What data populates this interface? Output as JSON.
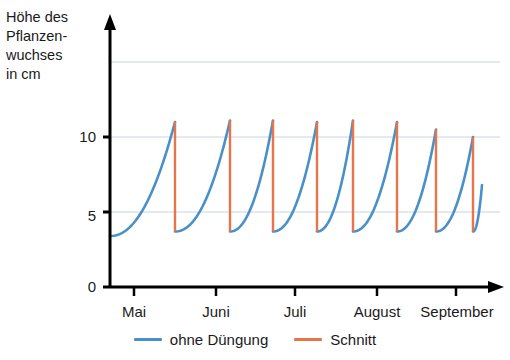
{
  "chart_data": {
    "type": "line",
    "title": "",
    "ylabel_lines": [
      "Höhe des",
      "Pflanzen-",
      "wuchses",
      "in cm"
    ],
    "ylabel": "Höhe des Pflanzenwuchses in cm",
    "xlabel": "",
    "ylim": [
      0,
      17
    ],
    "yticks": [
      0,
      5,
      10
    ],
    "ytick_labels": [
      "0",
      "5",
      "10"
    ],
    "gridlines_y": [
      5,
      10,
      15
    ],
    "grid": true,
    "xtick_labels": [
      "Mai",
      "Juni",
      "Juli",
      "August",
      "September"
    ],
    "xtick_positions": [
      134,
      216,
      295,
      377,
      456
    ],
    "legend_position": "bottom-center",
    "series": [
      {
        "name": "ohne Düngung",
        "color": "#4a90c8",
        "type": "growth-curve",
        "description": "Wachstumskurve zwischen den Schnitten, steigt jeweils von ca. 3,7 cm auf die Schnitthöhe an",
        "cut_to_height": 3.7,
        "start_height": 3.4,
        "end_height": 6.8,
        "peaks": [
          11.0,
          11.1,
          11.1,
          11.0,
          11.1,
          11.0,
          10.5,
          10.0
        ]
      },
      {
        "name": "Schnitt",
        "color": "#e8744a",
        "type": "vertical-drop",
        "description": "Senkrechter Abfall beim Schnitt auf ca. 3,7 cm",
        "cut_x_positions": [
          175,
          230,
          273,
          317,
          353,
          397,
          436,
          473
        ],
        "cut_from": [
          11.0,
          11.1,
          11.1,
          11.0,
          11.1,
          11.0,
          10.5,
          10.0
        ],
        "cut_to": 3.7
      }
    ]
  },
  "legend": {
    "items": [
      {
        "label": "ohne Düngung",
        "color": "#4a90c8"
      },
      {
        "label": "Schnitt",
        "color": "#e8744a"
      }
    ]
  },
  "axis": {
    "y_title_line1": "Höhe des",
    "y_title_line2": "Pflanzen-",
    "y_title_line3": "wuchses",
    "y_title_line4": "in cm",
    "y_tick_0": "0",
    "y_tick_5": "5",
    "y_tick_10": "10",
    "x_tick_1": "Mai",
    "x_tick_2": "Juni",
    "x_tick_3": "Juli",
    "x_tick_4": "August",
    "x_tick_5": "September"
  },
  "colors": {
    "curve": "#4a90c8",
    "cut": "#e8744a",
    "axis": "#000000",
    "grid": "#c9d4de",
    "text": "#1a1a1a"
  }
}
